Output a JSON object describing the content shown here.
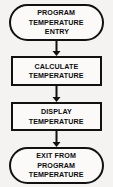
{
  "diagram": {
    "colors": {
      "background": "#f4f3f1",
      "node_fill": "#fbfaf9",
      "stroke": "#111111",
      "text": "#0d0d0d"
    },
    "nodes": [
      {
        "id": "entry",
        "shape": "terminator",
        "lines": [
          "PROGRAM",
          "TEMPERATURE",
          "ENTRY"
        ]
      },
      {
        "id": "calculate",
        "shape": "process",
        "lines": [
          "CALCULATE",
          "TEMPERATURE"
        ]
      },
      {
        "id": "display",
        "shape": "process",
        "lines": [
          "DISPLAY",
          "TEMPERATURE"
        ]
      },
      {
        "id": "exit",
        "shape": "terminator",
        "lines": [
          "EXIT FROM",
          "PROGRAM",
          "TEMPERATURE"
        ]
      }
    ],
    "connectors": [
      {
        "id": "entry-to-calculate",
        "from": "entry",
        "to": "calculate",
        "direction": "down",
        "arrowhead": true
      },
      {
        "id": "calculate-to-display",
        "from": "calculate",
        "to": "display",
        "direction": "down",
        "arrowhead": true
      },
      {
        "id": "display-to-exit",
        "from": "display",
        "to": "exit",
        "direction": "down",
        "arrowhead": true
      }
    ]
  }
}
